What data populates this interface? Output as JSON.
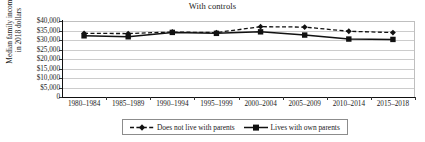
{
  "chart_data": {
    "type": "line",
    "title": "With controls",
    "xlabel": "",
    "ylabel": "Median family income in 2018 dollars",
    "ylabel_line1": "Median family income",
    "ylabel_line2": "in 2018 dollars",
    "categories": [
      "1980–1984",
      "1985–1989",
      "1990–1994",
      "1995–1999",
      "2000–2004",
      "2005–2009",
      "2010–2014",
      "2015–2018"
    ],
    "ytick_labels": [
      "$40,000",
      "$35,000",
      "$30,000",
      "$25,000",
      "$20,000",
      "$15,000",
      "$10,000",
      "$5,000",
      "0"
    ],
    "ytick_values": [
      40000,
      35000,
      30000,
      25000,
      20000,
      15000,
      10000,
      5000,
      0
    ],
    "ylim": [
      0,
      40000
    ],
    "grid": true,
    "legend_position": "bottom",
    "series": [
      {
        "name": "Does not live with parents",
        "values": [
          33500,
          33400,
          34200,
          33900,
          37000,
          36800,
          34600,
          33900
        ],
        "line_style": "dashed",
        "marker": "diamond",
        "color": "#111111"
      },
      {
        "name": "Lives with own parents",
        "values": [
          32200,
          31700,
          34000,
          33500,
          34300,
          32600,
          30500,
          30300
        ],
        "line_style": "solid",
        "marker": "square",
        "color": "#111111"
      }
    ]
  },
  "legend": {
    "entries": [
      {
        "label": "Does not live with parents"
      },
      {
        "label": "Lives with own parents"
      }
    ]
  }
}
